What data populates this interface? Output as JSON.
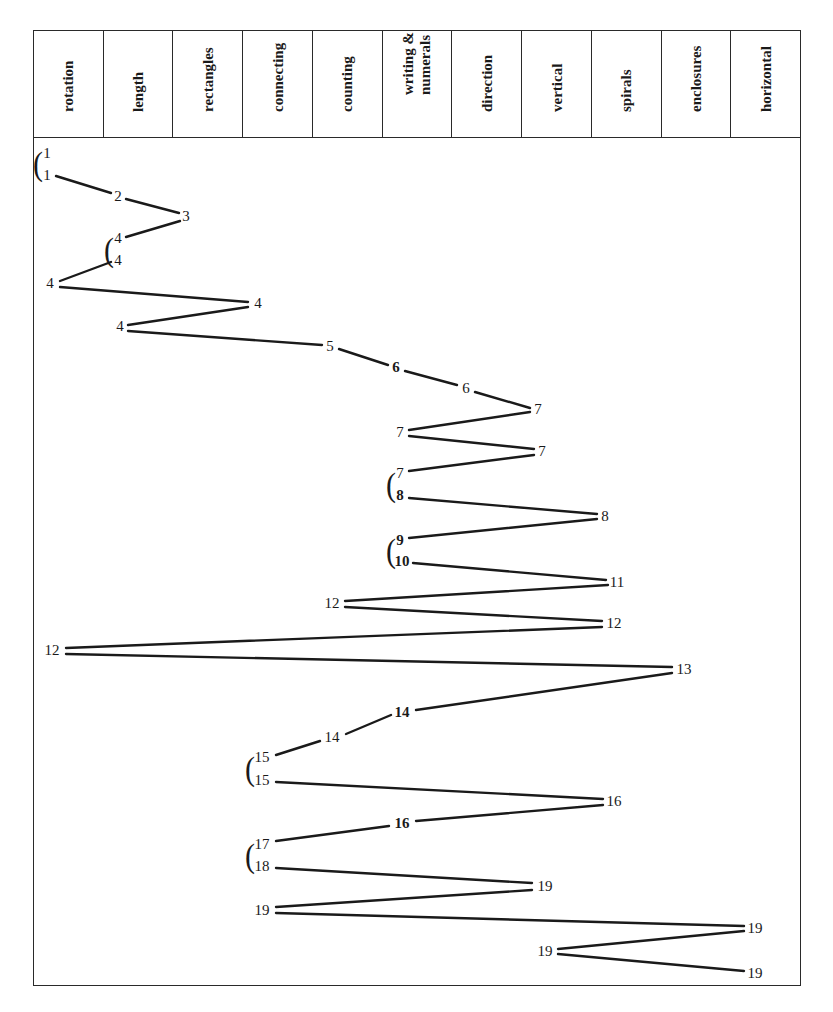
{
  "header": {
    "columns": [
      {
        "label": "rotation"
      },
      {
        "label": "length"
      },
      {
        "label": "rectangles"
      },
      {
        "label": "connecting"
      },
      {
        "label": "counting"
      },
      {
        "label": "writing &\nnumerals"
      },
      {
        "label": "direction"
      },
      {
        "label": "vertical"
      },
      {
        "label": "spirals"
      },
      {
        "label": "enclosures"
      },
      {
        "label": "horizontal"
      }
    ]
  },
  "chart_data": {
    "type": "line",
    "title": "",
    "categories": [
      "rotation",
      "length",
      "rectangles",
      "connecting",
      "counting",
      "writing & numerals",
      "direction",
      "vertical",
      "spirals",
      "enclosures",
      "horizontal"
    ],
    "nodes": [
      {
        "label": "1",
        "x": 47,
        "y": 153,
        "bold": false
      },
      {
        "label": "1",
        "x": 47,
        "y": 175,
        "bold": false
      },
      {
        "label": "2",
        "x": 118,
        "y": 196,
        "bold": false
      },
      {
        "label": "3",
        "x": 186,
        "y": 216,
        "bold": false
      },
      {
        "label": "4",
        "x": 118,
        "y": 238,
        "bold": false
      },
      {
        "label": "4",
        "x": 118,
        "y": 260,
        "bold": false
      },
      {
        "label": "4",
        "x": 50,
        "y": 283,
        "bold": false
      },
      {
        "label": "4",
        "x": 258,
        "y": 303,
        "bold": false
      },
      {
        "label": "4",
        "x": 120,
        "y": 326,
        "bold": false
      },
      {
        "label": "5",
        "x": 330,
        "y": 346,
        "bold": false
      },
      {
        "label": "6",
        "x": 396,
        "y": 367,
        "bold": true
      },
      {
        "label": "6",
        "x": 466,
        "y": 388,
        "bold": false
      },
      {
        "label": "7",
        "x": 538,
        "y": 409,
        "bold": false
      },
      {
        "label": "7",
        "x": 400,
        "y": 432,
        "bold": false
      },
      {
        "label": "7",
        "x": 542,
        "y": 451,
        "bold": false
      },
      {
        "label": "7",
        "x": 400,
        "y": 473,
        "bold": false
      },
      {
        "label": "8",
        "x": 400,
        "y": 495,
        "bold": true
      },
      {
        "label": "8",
        "x": 605,
        "y": 516,
        "bold": false
      },
      {
        "label": "9",
        "x": 400,
        "y": 540,
        "bold": true
      },
      {
        "label": "10",
        "x": 402,
        "y": 561,
        "bold": true
      },
      {
        "label": "11",
        "x": 617,
        "y": 582,
        "bold": false
      },
      {
        "label": "12",
        "x": 332,
        "y": 603,
        "bold": false
      },
      {
        "label": "12",
        "x": 614,
        "y": 623,
        "bold": false
      },
      {
        "label": "12",
        "x": 52,
        "y": 650,
        "bold": false
      },
      {
        "label": "13",
        "x": 684,
        "y": 669,
        "bold": false
      },
      {
        "label": "14",
        "x": 402,
        "y": 712,
        "bold": true
      },
      {
        "label": "14",
        "x": 332,
        "y": 737,
        "bold": false
      },
      {
        "label": "15",
        "x": 262,
        "y": 757,
        "bold": false
      },
      {
        "label": "15",
        "x": 262,
        "y": 780,
        "bold": false
      },
      {
        "label": "16",
        "x": 614,
        "y": 801,
        "bold": false
      },
      {
        "label": "16",
        "x": 402,
        "y": 823,
        "bold": true
      },
      {
        "label": "17",
        "x": 262,
        "y": 844,
        "bold": false
      },
      {
        "label": "18",
        "x": 262,
        "y": 866,
        "bold": false
      },
      {
        "label": "19",
        "x": 545,
        "y": 886,
        "bold": false
      },
      {
        "label": "19",
        "x": 262,
        "y": 910,
        "bold": false
      },
      {
        "label": "19",
        "x": 755,
        "y": 928,
        "bold": false
      },
      {
        "label": "19",
        "x": 545,
        "y": 951,
        "bold": false
      },
      {
        "label": "19",
        "x": 755,
        "y": 973,
        "bold": false
      }
    ],
    "brackets": [
      {
        "x": 38,
        "y": 163
      },
      {
        "x": 109,
        "y": 249
      },
      {
        "x": 391,
        "y": 484
      },
      {
        "x": 391,
        "y": 550
      },
      {
        "x": 250,
        "y": 768
      },
      {
        "x": 250,
        "y": 855
      }
    ],
    "segments": [
      [
        56,
        176,
        111,
        193
      ],
      [
        126,
        199,
        179,
        213
      ],
      [
        180,
        221,
        126,
        237
      ],
      [
        111,
        262,
        60,
        281
      ],
      [
        60,
        287,
        248,
        302
      ],
      [
        248,
        307,
        128,
        325
      ],
      [
        128,
        331,
        322,
        345
      ],
      [
        339,
        349,
        388,
        365
      ],
      [
        405,
        371,
        457,
        385
      ],
      [
        475,
        392,
        530,
        408
      ],
      [
        530,
        412,
        409,
        430
      ],
      [
        409,
        436,
        534,
        449
      ],
      [
        534,
        455,
        409,
        471
      ],
      [
        409,
        498,
        597,
        514
      ],
      [
        597,
        519,
        409,
        538
      ],
      [
        413,
        563,
        606,
        580
      ],
      [
        608,
        585,
        345,
        601
      ],
      [
        345,
        607,
        602,
        621
      ],
      [
        602,
        627,
        66,
        648
      ],
      [
        66,
        654,
        672,
        667
      ],
      [
        672,
        673,
        416,
        710
      ],
      [
        391,
        715,
        346,
        734
      ],
      [
        320,
        741,
        276,
        755
      ],
      [
        276,
        782,
        603,
        799
      ],
      [
        603,
        805,
        416,
        821
      ],
      [
        389,
        826,
        276,
        841
      ],
      [
        276,
        868,
        532,
        883
      ],
      [
        532,
        890,
        276,
        907
      ],
      [
        276,
        913,
        744,
        926
      ],
      [
        744,
        931,
        558,
        949
      ],
      [
        558,
        954,
        744,
        971
      ]
    ],
    "xlabel": "",
    "ylabel": "",
    "legend": []
  }
}
